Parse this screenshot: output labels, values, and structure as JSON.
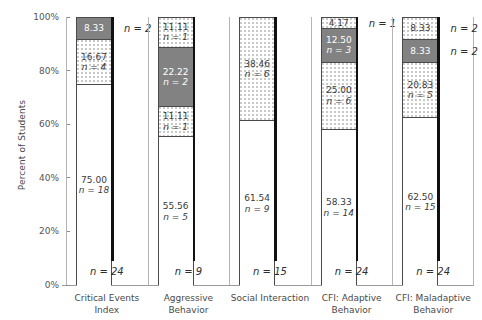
{
  "chart_data": {
    "type": "bar",
    "subtype": "stacked-percent",
    "title": "",
    "xlabel": "",
    "ylabel": "Percent of Students",
    "ylim": [
      0,
      100
    ],
    "ytick_labels": [
      "0%",
      "20%",
      "40%",
      "60%",
      "80%",
      "100%"
    ],
    "ytick_values": [
      0,
      20,
      40,
      60,
      80,
      100
    ],
    "grid": false,
    "legend": "none",
    "categories": [
      "Critical Events Index",
      "Aggressive Behavior",
      "Social Interaction",
      "CFI: Adaptive Behavior",
      "CFI: Maladaptive Behavior"
    ],
    "groups": [
      {
        "label_line1": "Critical Events",
        "label_line2": "Index",
        "total_n_label": "n = 24",
        "total_n": 24,
        "segments": [
          {
            "value": 75.0,
            "pct_label": "75.00",
            "n": 18,
            "n_label": "n = 18",
            "fill": "white",
            "label_inside": true
          },
          {
            "value": 16.67,
            "pct_label": "16.67",
            "n": 4,
            "n_label": "n = 4",
            "fill": "dotted",
            "label_inside": true
          },
          {
            "value": 8.33,
            "pct_label": "8.33",
            "n": 2,
            "n_label": "n = 2",
            "fill": "gray",
            "label_inside": true,
            "external_n": true
          }
        ]
      },
      {
        "label_line1": "Aggressive",
        "label_line2": "Behavior",
        "total_n_label": "n = 9",
        "total_n": 9,
        "segments": [
          {
            "value": 55.56,
            "pct_label": "55.56",
            "n": 5,
            "n_label": "n = 5",
            "fill": "white",
            "label_inside": true
          },
          {
            "value": 11.11,
            "pct_label": "11.11",
            "n": 1,
            "n_label": "n = 1",
            "fill": "dotted",
            "label_inside": true
          },
          {
            "value": 22.22,
            "pct_label": "22.22",
            "n": 2,
            "n_label": "n = 2",
            "fill": "gray",
            "label_inside": true
          },
          {
            "value": 11.11,
            "pct_label": "11.11",
            "n": 1,
            "n_label": "n = 1",
            "fill": "dotted",
            "label_inside": true
          }
        ]
      },
      {
        "label_line1": "Social Interaction",
        "label_line2": "",
        "total_n_label": "n = 15",
        "total_n": 15,
        "segments": [
          {
            "value": 61.54,
            "pct_label": "61.54",
            "n": 9,
            "n_label": "n = 9",
            "fill": "white",
            "label_inside": true
          },
          {
            "value": 38.46,
            "pct_label": "38.46",
            "n": 6,
            "n_label": "n = 6",
            "fill": "dotted",
            "label_inside": true
          }
        ]
      },
      {
        "label_line1": "CFI: Adaptive",
        "label_line2": "Behavior",
        "total_n_label": "n = 24",
        "total_n": 24,
        "segments": [
          {
            "value": 58.33,
            "pct_label": "58.33",
            "n": 14,
            "n_label": "n = 14",
            "fill": "white",
            "label_inside": true
          },
          {
            "value": 25.0,
            "pct_label": "25.00",
            "n": 6,
            "n_label": "n = 6",
            "fill": "dotted",
            "label_inside": true
          },
          {
            "value": 12.5,
            "pct_label": "12.50",
            "n": 3,
            "n_label": "n = 3",
            "fill": "gray",
            "label_inside": true
          },
          {
            "value": 4.17,
            "pct_label": "4.17",
            "n": 1,
            "n_label": "n = 1",
            "fill": "dotted",
            "label_inside": true,
            "external_n": true
          }
        ]
      },
      {
        "label_line1": "CFI: Maladaptive",
        "label_line2": "Behavior",
        "total_n_label": "n = 24",
        "total_n": 24,
        "segments": [
          {
            "value": 62.5,
            "pct_label": "62.50",
            "n": 15,
            "n_label": "n = 15",
            "fill": "white",
            "label_inside": true
          },
          {
            "value": 20.83,
            "pct_label": "20.83",
            "n": 5,
            "n_label": "n = 5",
            "fill": "dotted",
            "label_inside": true
          },
          {
            "value": 8.33,
            "pct_label": "8.33",
            "n": 2,
            "n_label": "n = 2",
            "fill": "gray",
            "label_inside": true,
            "external_n": true
          },
          {
            "value": 8.33,
            "pct_label": "8.33",
            "n": 2,
            "n_label": "n = 2",
            "fill": "dotted",
            "label_inside": true,
            "external_n": true
          }
        ]
      }
    ],
    "colors": {
      "segment_gray": "#828282",
      "segment_white": "#ffffff",
      "segment_dot": "#c9c9c9",
      "outline": "#4a4a4a",
      "thick_rule": "#111111",
      "axis": "#9a9a9a",
      "text": "#3a3a3a"
    }
  },
  "axis": {
    "y_title": "Percent of Students"
  }
}
